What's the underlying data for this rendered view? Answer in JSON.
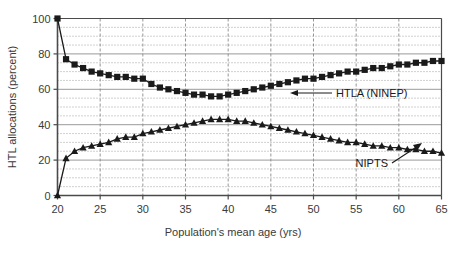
{
  "chart_data": {
    "type": "line",
    "title": "",
    "xlabel": "Population's mean age (yrs)",
    "ylabel": "HTL allocations (percent)",
    "xlim": [
      20,
      65
    ],
    "ylim": [
      0,
      100
    ],
    "xticks": [
      20,
      25,
      30,
      35,
      40,
      45,
      50,
      55,
      60,
      65
    ],
    "yticks": [
      0,
      20,
      40,
      60,
      80,
      100
    ],
    "grid": "major solid horizontal every 20, minor dotted horizontal every 5, dashed vertical every 5",
    "legend": "none (inline annotations with arrows)",
    "annotations": [
      {
        "text": "HTLA (NINEP)",
        "points_to_series": "HTLA (NINEP)",
        "arrow": "left"
      },
      {
        "text": "NIPTS",
        "points_to_series": "NIPTS",
        "arrow": "up-right"
      }
    ],
    "x": [
      20,
      21,
      22,
      23,
      24,
      25,
      26,
      27,
      28,
      29,
      30,
      31,
      32,
      33,
      34,
      35,
      36,
      37,
      38,
      39,
      40,
      41,
      42,
      43,
      44,
      45,
      46,
      47,
      48,
      49,
      50,
      51,
      52,
      53,
      54,
      55,
      56,
      57,
      58,
      59,
      60,
      61,
      62,
      63,
      64,
      65
    ],
    "series": [
      {
        "name": "HTLA (NINEP)",
        "marker": "square",
        "color": "#1a1a1a",
        "values": [
          100,
          77,
          74,
          72,
          70,
          69,
          68,
          67,
          67,
          66,
          66,
          63,
          61,
          60,
          59,
          58,
          57,
          57,
          56,
          56,
          57,
          58,
          59,
          60,
          61,
          62,
          63,
          64,
          65,
          66,
          66,
          67,
          68,
          69,
          70,
          70,
          71,
          72,
          72,
          73,
          74,
          74,
          75,
          75,
          76,
          76
        ]
      },
      {
        "name": "NIPTS",
        "marker": "triangle",
        "color": "#1a1a1a",
        "values": [
          0,
          21,
          25,
          27,
          28,
          29,
          30,
          32,
          33,
          33,
          35,
          36,
          37,
          38,
          39,
          40,
          41,
          42,
          43,
          43,
          43,
          42,
          42,
          41,
          40,
          39,
          38,
          37,
          36,
          35,
          34,
          33,
          32,
          31,
          30,
          30,
          29,
          28,
          28,
          27,
          27,
          26,
          26,
          25,
          25,
          24
        ]
      }
    ]
  }
}
